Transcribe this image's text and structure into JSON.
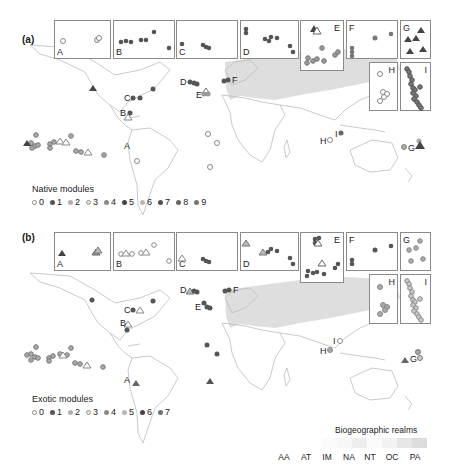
{
  "panels": [
    {
      "id": "a",
      "label": "(a)",
      "legend": {
        "title": "Native modules",
        "items": [
          {
            "label": "0",
            "color": "#ffffff",
            "stroke": "#888888"
          },
          {
            "label": "1",
            "color": "#555555",
            "stroke": "#555555"
          },
          {
            "label": "2",
            "color": "#b0b0b0",
            "stroke": "#888888"
          },
          {
            "label": "3",
            "color": "#e0e0e0",
            "stroke": "#999999"
          },
          {
            "label": "4",
            "color": "#8a8a8a",
            "stroke": "#777777"
          },
          {
            "label": "5",
            "color": "#444444",
            "stroke": "#444444"
          },
          {
            "label": "6",
            "color": "#b8b8b8",
            "stroke": "#999999"
          },
          {
            "label": "7",
            "color": "#505050",
            "stroke": "#505050"
          },
          {
            "label": "8",
            "color": "#666666",
            "stroke": "#555555"
          },
          {
            "label": "9",
            "color": "#777777",
            "stroke": "#666666"
          }
        ]
      },
      "insets": [
        "A",
        "B",
        "C",
        "D",
        "E",
        "F",
        "G",
        "H",
        "I"
      ],
      "map_labels": [
        "A",
        "B",
        "C",
        "D",
        "E",
        "F",
        "G",
        "H",
        "I"
      ]
    },
    {
      "id": "b",
      "label": "(b)",
      "legend": {
        "title": "Exotic modules",
        "items": [
          {
            "label": "0",
            "color": "#ffffff",
            "stroke": "#888888"
          },
          {
            "label": "1",
            "color": "#555555",
            "stroke": "#555555"
          },
          {
            "label": "2",
            "color": "#b0b0b0",
            "stroke": "#888888"
          },
          {
            "label": "3",
            "color": "#e0e0e0",
            "stroke": "#999999"
          },
          {
            "label": "4",
            "color": "#8a8a8a",
            "stroke": "#777777"
          },
          {
            "label": "5",
            "color": "#b8b8b8",
            "stroke": "#999999"
          },
          {
            "label": "6",
            "color": "#444444",
            "stroke": "#444444"
          },
          {
            "label": "7",
            "color": "#707070",
            "stroke": "#606060"
          }
        ]
      },
      "insets": [
        "A",
        "B",
        "C",
        "D",
        "E",
        "F",
        "G",
        "H",
        "I"
      ],
      "map_labels": [
        "A",
        "B",
        "C",
        "D",
        "E",
        "F",
        "G",
        "H",
        "I"
      ]
    }
  ],
  "realms": {
    "title": "Biogeographic realms",
    "items": [
      {
        "code": "AA",
        "color": "#fafafa"
      },
      {
        "code": "AT",
        "color": "#f7f7f7"
      },
      {
        "code": "IM",
        "color": "#eeeeee"
      },
      {
        "code": "NA",
        "color": "#fbfbfb"
      },
      {
        "code": "NT",
        "color": "#f2f2f2"
      },
      {
        "code": "OC",
        "color": "#e6e6e6"
      },
      {
        "code": "PA",
        "color": "#dcdcdc"
      }
    ]
  },
  "colors": {
    "land_outline": "#bdbdbd",
    "palearctic_fill": "#dedede",
    "inset_border": "#8a8a8a"
  }
}
